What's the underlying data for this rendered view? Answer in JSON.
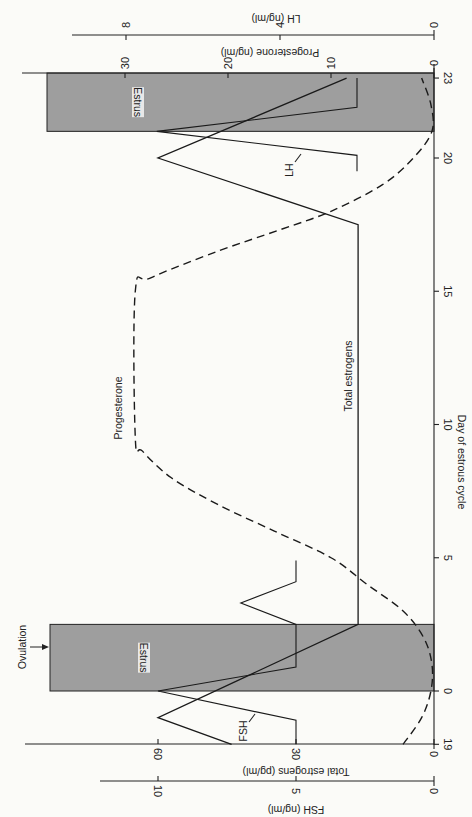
{
  "chart_data": {
    "type": "line",
    "orientation": "rotated-90 (day axis vertical on right, values increase leftward)",
    "title": "",
    "xlabel": "Day of estrous cycle",
    "x_ticks": [
      "19",
      "0",
      "5",
      "10",
      "15",
      "20",
      "23"
    ],
    "x_tick_days": [
      -2,
      0,
      5,
      10,
      15,
      20,
      23
    ],
    "axes": [
      {
        "id": "estrogens",
        "label": "Total estrogens (pg/ml)",
        "ticks": [
          0,
          30,
          60
        ],
        "position": "bottom-inner"
      },
      {
        "id": "fsh",
        "label": "FSH (ng/ml)",
        "ticks": [
          0,
          5,
          10
        ],
        "position": "bottom-outer"
      },
      {
        "id": "progesterone",
        "label": "Progesterone (ng/ml)",
        "ticks": [
          0,
          10,
          20,
          30
        ],
        "position": "top-inner"
      },
      {
        "id": "lh",
        "label": "LH (ng/ml)",
        "ticks": [
          0,
          4,
          8
        ],
        "position": "top-outer"
      }
    ],
    "series": [
      {
        "name": "Total estrogens",
        "axis": "estrogens",
        "style": "solid",
        "points": [
          [
            -2,
            44
          ],
          [
            -1,
            60
          ],
          [
            2.5,
            16.5
          ],
          [
            17.5,
            16.5
          ],
          [
            20,
            60
          ],
          [
            23,
            19
          ]
        ]
      },
      {
        "name": "FSH",
        "axis": "fsh",
        "style": "solid",
        "points": [
          [
            -2,
            5
          ],
          [
            -1.1,
            5
          ],
          [
            0,
            10
          ],
          [
            0.9,
            5
          ],
          [
            2.5,
            5
          ],
          [
            3.3,
            7
          ],
          [
            4.1,
            5
          ],
          [
            4.9,
            5
          ]
        ]
      },
      {
        "name": "LH",
        "axis": "lh",
        "style": "solid",
        "points": [
          [
            19.5,
            2
          ],
          [
            20.1,
            2
          ],
          [
            21,
            7.2
          ],
          [
            21.9,
            2
          ],
          [
            23,
            2
          ]
        ]
      },
      {
        "name": "Progesterone",
        "axis": "progesterone",
        "style": "dashed",
        "points": [
          [
            -2,
            3
          ],
          [
            -1,
            1.2
          ],
          [
            0,
            0.3
          ],
          [
            1,
            0.2
          ],
          [
            2,
            1
          ],
          [
            3,
            3
          ],
          [
            4,
            6.5
          ],
          [
            5,
            10
          ],
          [
            6,
            15.5
          ],
          [
            7,
            21
          ],
          [
            8,
            25.5
          ],
          [
            9,
            28.3
          ],
          [
            9.5,
            29
          ],
          [
            15,
            29
          ],
          [
            15.5,
            27.5
          ],
          [
            16.5,
            21
          ],
          [
            17.3,
            15
          ],
          [
            18,
            10
          ],
          [
            19,
            5
          ],
          [
            20,
            2
          ],
          [
            21,
            0.2
          ],
          [
            22,
            0.3
          ],
          [
            23,
            1.2
          ]
        ]
      }
    ],
    "shaded_regions": [
      {
        "label": "Estrus",
        "day_start": 0,
        "day_end": 2.5
      },
      {
        "label": "Estrus",
        "day_start": 21,
        "day_end": 23.5
      }
    ],
    "annotations": [
      {
        "text": "Ovulation",
        "day": 1.6,
        "type": "arrow"
      },
      {
        "text": "FSH",
        "near_series": "FSH"
      },
      {
        "text": "LH",
        "near_series": "LH"
      },
      {
        "text": "Progesterone",
        "near_series": "Progesterone"
      },
      {
        "text": "Total estrogens",
        "near_series": "Total estrogens"
      }
    ]
  },
  "labels": {
    "xlabel": "Day of estrous cycle",
    "estrogens_axis": "Total estrogens (pg/ml)",
    "fsh_axis": "FSH (ng/ml)",
    "progesterone_axis": "Progesterone (ng/ml)",
    "lh_axis": "LH (ng/ml)",
    "estrus": "Estrus",
    "ovulation": "Ovulation",
    "fsh": "FSH",
    "lh": "LH",
    "progesterone": "Progesterone",
    "total_estrogens": "Total estrogens"
  }
}
